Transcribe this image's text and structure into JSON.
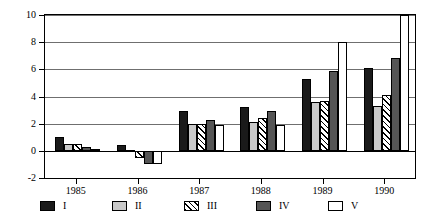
{
  "chart_data": {
    "type": "bar",
    "title": "",
    "subtitle": "",
    "xlabel": "",
    "ylabel": "",
    "categories": [
      "1985",
      "1986",
      "1987",
      "1988",
      "1989",
      "1990"
    ],
    "series": [
      {
        "name": "I",
        "values": [
          1.0,
          0.4,
          2.9,
          3.2,
          5.3,
          6.1
        ],
        "swatch": "solid-black",
        "color": "#1a1a1a"
      },
      {
        "name": "II",
        "values": [
          0.5,
          0.05,
          2.0,
          2.1,
          3.6,
          3.3
        ],
        "swatch": "solid-light-gray",
        "color": "#c9c9c9"
      },
      {
        "name": "III",
        "values": [
          0.5,
          -0.5,
          2.0,
          2.4,
          3.7,
          4.1
        ],
        "swatch": "diagonal-hatch",
        "color": "#000000"
      },
      {
        "name": "IV",
        "values": [
          0.3,
          -1.0,
          2.3,
          2.9,
          5.9,
          6.8
        ],
        "swatch": "solid-dark-gray",
        "color": "#555555"
      },
      {
        "name": "V",
        "values": [
          0.1,
          -1.0,
          1.9,
          1.9,
          8.0,
          10.0
        ],
        "swatch": "dotted-stipple",
        "color": "#000000"
      }
    ],
    "ylim": [
      -2,
      10
    ],
    "yticks": [
      -2,
      0,
      2,
      4,
      6,
      8,
      10
    ],
    "ytick_labels": [
      "-2",
      "0",
      "2",
      "4",
      "6",
      "8",
      "10"
    ],
    "gridlines_at": [
      2,
      4,
      6,
      8,
      10
    ],
    "zero_line": 0,
    "grid": true,
    "legend_position": "bottom",
    "legend_entries": [
      "I",
      "II",
      "III",
      "IV",
      "V"
    ],
    "axis_color": "#000000",
    "grid_color": "#6f6f6f",
    "background": "#ffffff"
  }
}
